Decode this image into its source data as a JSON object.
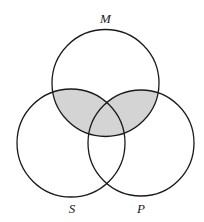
{
  "diagram": {
    "type": "venn",
    "sets": [
      {
        "id": "M",
        "label": "M"
      },
      {
        "id": "S",
        "label": "S"
      },
      {
        "id": "P",
        "label": "P"
      }
    ],
    "shaded_regions": [
      "M∩S",
      "M∩P"
    ],
    "shaded_description": "Region of M overlapping S or P is shaded",
    "colors": {
      "outline": "#1a1a1a",
      "shade": "#d4d4d4",
      "background": "#ffffff",
      "label": "#222222"
    }
  }
}
